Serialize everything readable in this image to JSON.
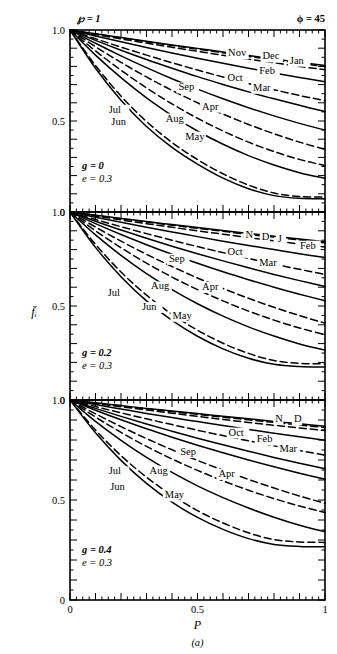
{
  "figure": {
    "caption": "(a)",
    "top_left_param": "℘ = 1",
    "top_right_param": "ϕ = 45",
    "ylabel": "f̄ᵢ",
    "xlabel": "P"
  },
  "axes": {
    "x_ticks": [
      "0",
      "0.5",
      "1"
    ],
    "x_tick_values": [
      0,
      0.5,
      1
    ],
    "x_minor_step": 0.025,
    "x_major_step": 0.1,
    "xlim": [
      0,
      1
    ],
    "y_ticks": [
      "0",
      "0.5",
      "1.0"
    ],
    "y_tick_values": [
      0,
      0.5,
      1.0
    ],
    "y_minor_step": 0.05,
    "y_major_step": 0.1,
    "ylim": [
      0,
      1.0
    ],
    "grid": false
  },
  "panels": [
    {
      "id": "panel-top",
      "g_label": "g = 0",
      "e_label": "e = 0.3",
      "g": 0,
      "e": 0.3,
      "y_top_label": "1.0",
      "y_mid_label": "0.5",
      "y_bot_label": "0",
      "curve_labels": [
        {
          "text": "Nov",
          "x": 0.62,
          "y": 0.855
        },
        {
          "text": "Dec",
          "x": 0.755,
          "y": 0.838
        },
        {
          "text": "Jan",
          "x": 0.862,
          "y": 0.815
        },
        {
          "text": "Feb",
          "x": 0.742,
          "y": 0.757
        },
        {
          "text": "Oct",
          "x": 0.618,
          "y": 0.718
        },
        {
          "text": "Mar",
          "x": 0.718,
          "y": 0.666
        },
        {
          "text": "Sep",
          "x": 0.425,
          "y": 0.668
        },
        {
          "text": "Apr",
          "x": 0.518,
          "y": 0.562
        },
        {
          "text": "Jul",
          "x": 0.152,
          "y": 0.545
        },
        {
          "text": "Jun",
          "x": 0.162,
          "y": 0.478
        },
        {
          "text": "Aug",
          "x": 0.375,
          "y": 0.497
        },
        {
          "text": "May",
          "x": 0.452,
          "y": 0.398
        }
      ]
    },
    {
      "id": "panel-middle",
      "g_label": "g = 0.2",
      "e_label": "e = 0.3",
      "g": 0.2,
      "e": 0.3,
      "y_top_label": "1.0",
      "y_mid_label": "0.5",
      "y_bot_label": "0",
      "curve_labels": [
        {
          "text": "N",
          "x": 0.688,
          "y": 0.862
        },
        {
          "text": "D",
          "x": 0.752,
          "y": 0.852
        },
        {
          "text": "J",
          "x": 0.815,
          "y": 0.838
        },
        {
          "text": "Feb",
          "x": 0.902,
          "y": 0.805
        },
        {
          "text": "Oct",
          "x": 0.618,
          "y": 0.772
        },
        {
          "text": "Mar",
          "x": 0.742,
          "y": 0.712
        },
        {
          "text": "Sep",
          "x": 0.388,
          "y": 0.735
        },
        {
          "text": "Apr",
          "x": 0.518,
          "y": 0.585
        },
        {
          "text": "Aug",
          "x": 0.318,
          "y": 0.588
        },
        {
          "text": "Jul",
          "x": 0.148,
          "y": 0.552
        },
        {
          "text": "Jun",
          "x": 0.282,
          "y": 0.478
        },
        {
          "text": "May",
          "x": 0.402,
          "y": 0.432
        }
      ]
    },
    {
      "id": "panel-bottom",
      "g_label": "g = 0.4",
      "e_label": "e = 0.3",
      "g": 0.4,
      "e": 0.3,
      "y_top_label": "1.0",
      "y_mid_label": "0.5",
      "y_bot_label": "0",
      "curve_labels": [
        {
          "text": "N",
          "x": 0.805,
          "y": 0.892
        },
        {
          "text": "D",
          "x": 0.878,
          "y": 0.888
        },
        {
          "text": "Oct",
          "x": 0.622,
          "y": 0.822
        },
        {
          "text": "Feb",
          "x": 0.732,
          "y": 0.788
        },
        {
          "text": "Mar",
          "x": 0.822,
          "y": 0.742
        },
        {
          "text": "Sep",
          "x": 0.432,
          "y": 0.725
        },
        {
          "text": "Apr",
          "x": 0.582,
          "y": 0.615
        },
        {
          "text": "Aug",
          "x": 0.312,
          "y": 0.632
        },
        {
          "text": "Jul",
          "x": 0.152,
          "y": 0.628
        },
        {
          "text": "Jun",
          "x": 0.158,
          "y": 0.552
        },
        {
          "text": "May",
          "x": 0.372,
          "y": 0.508
        }
      ]
    }
  ],
  "chart_data": {
    "type": "line",
    "title": "",
    "xlabel": "P",
    "ylabel": "f̄ᵢ",
    "xlim": [
      0,
      1
    ],
    "ylim": [
      0,
      1
    ],
    "grid": false,
    "legend": "inline-curve-labels",
    "subplots": [
      {
        "name": "g = 0, e = 0.3",
        "x": [
          0,
          0.1,
          0.2,
          0.3,
          0.4,
          0.5,
          0.6,
          0.7,
          0.8,
          0.9,
          1.0
        ],
        "series": [
          {
            "name": "Jan",
            "style": "dashed",
            "values": [
              1.0,
              0.975,
              0.951,
              0.928,
              0.905,
              0.883,
              0.861,
              0.84,
              0.82,
              0.8,
              0.782
            ]
          },
          {
            "name": "Feb",
            "style": "solid",
            "values": [
              1.0,
              0.967,
              0.935,
              0.904,
              0.874,
              0.845,
              0.817,
              0.79,
              0.764,
              0.739,
              0.716
            ]
          },
          {
            "name": "Mar",
            "style": "dashed",
            "values": [
              1.0,
              0.952,
              0.906,
              0.862,
              0.82,
              0.78,
              0.742,
              0.706,
              0.672,
              0.64,
              0.612
            ]
          },
          {
            "name": "Apr",
            "style": "solid",
            "values": [
              1.0,
              0.927,
              0.858,
              0.793,
              0.732,
              0.675,
              0.622,
              0.573,
              0.528,
              0.487,
              0.45
            ]
          },
          {
            "name": "May",
            "style": "dashed",
            "values": [
              1.0,
              0.885,
              0.779,
              0.682,
              0.594,
              0.515,
              0.445,
              0.384,
              0.332,
              0.289,
              0.255
            ]
          },
          {
            "name": "Jun",
            "style": "solid",
            "values": [
              1.0,
              0.79,
              0.614,
              0.47,
              0.355,
              0.263,
              0.186,
              0.128,
              0.09,
              0.075,
              0.072
            ]
          },
          {
            "name": "Jul",
            "style": "dashed",
            "values": [
              1.0,
              0.805,
              0.637,
              0.497,
              0.382,
              0.288,
              0.21,
              0.148,
              0.104,
              0.085,
              0.082
            ]
          },
          {
            "name": "Aug",
            "style": "solid",
            "values": [
              1.0,
              0.862,
              0.738,
              0.627,
              0.53,
              0.445,
              0.372,
              0.31,
              0.258,
              0.216,
              0.185
            ]
          },
          {
            "name": "Sep",
            "style": "dashed",
            "values": [
              1.0,
              0.908,
              0.822,
              0.742,
              0.668,
              0.6,
              0.538,
              0.481,
              0.43,
              0.384,
              0.344
            ]
          },
          {
            "name": "Oct",
            "style": "solid",
            "values": [
              1.0,
              0.943,
              0.889,
              0.838,
              0.79,
              0.744,
              0.701,
              0.66,
              0.622,
              0.586,
              0.552
            ]
          },
          {
            "name": "Nov",
            "style": "dashed",
            "values": [
              1.0,
              0.978,
              0.957,
              0.936,
              0.915,
              0.895,
              0.875,
              0.855,
              0.836,
              0.817,
              0.799
            ]
          },
          {
            "name": "Dec",
            "style": "solid",
            "values": [
              1.0,
              0.979,
              0.959,
              0.938,
              0.918,
              0.899,
              0.879,
              0.86,
              0.841,
              0.823,
              0.805
            ]
          }
        ]
      },
      {
        "name": "g = 0.2, e = 0.3",
        "x": [
          0,
          0.1,
          0.2,
          0.3,
          0.4,
          0.5,
          0.6,
          0.7,
          0.8,
          0.9,
          1.0
        ],
        "series": [
          {
            "name": "Jan",
            "style": "dashed",
            "values": [
              1.0,
              0.979,
              0.958,
              0.938,
              0.919,
              0.9,
              0.882,
              0.864,
              0.847,
              0.83,
              0.814
            ]
          },
          {
            "name": "Feb",
            "style": "solid",
            "values": [
              1.0,
              0.972,
              0.945,
              0.919,
              0.894,
              0.869,
              0.845,
              0.822,
              0.8,
              0.778,
              0.758
            ]
          },
          {
            "name": "Mar",
            "style": "dashed",
            "values": [
              1.0,
              0.96,
              0.922,
              0.885,
              0.85,
              0.816,
              0.784,
              0.753,
              0.723,
              0.695,
              0.668
            ]
          },
          {
            "name": "Apr",
            "style": "solid",
            "values": [
              1.0,
              0.938,
              0.88,
              0.826,
              0.775,
              0.727,
              0.682,
              0.64,
              0.6,
              0.563,
              0.528
            ]
          },
          {
            "name": "May",
            "style": "dashed",
            "values": [
              1.0,
              0.9,
              0.81,
              0.728,
              0.654,
              0.587,
              0.527,
              0.473,
              0.425,
              0.383,
              0.348
            ]
          },
          {
            "name": "Jun",
            "style": "solid",
            "values": [
              1.0,
              0.812,
              0.656,
              0.527,
              0.423,
              0.339,
              0.272,
              0.222,
              0.19,
              0.178,
              0.175
            ]
          },
          {
            "name": "Jul",
            "style": "dashed",
            "values": [
              1.0,
              0.828,
              0.681,
              0.558,
              0.456,
              0.371,
              0.302,
              0.248,
              0.21,
              0.195,
              0.192
            ]
          },
          {
            "name": "Aug",
            "style": "solid",
            "values": [
              1.0,
              0.878,
              0.769,
              0.672,
              0.587,
              0.512,
              0.446,
              0.389,
              0.34,
              0.298,
              0.265
            ]
          },
          {
            "name": "Sep",
            "style": "dashed",
            "values": [
              1.0,
              0.92,
              0.845,
              0.775,
              0.71,
              0.649,
              0.593,
              0.541,
              0.493,
              0.449,
              0.409
            ]
          },
          {
            "name": "Oct",
            "style": "solid",
            "values": [
              1.0,
              0.951,
              0.904,
              0.86,
              0.818,
              0.778,
              0.74,
              0.703,
              0.668,
              0.635,
              0.604
            ]
          },
          {
            "name": "Nov",
            "style": "dashed",
            "values": [
              1.0,
              0.982,
              0.964,
              0.947,
              0.93,
              0.913,
              0.897,
              0.881,
              0.866,
              0.851,
              0.836
            ]
          },
          {
            "name": "Dec",
            "style": "solid",
            "values": [
              1.0,
              0.983,
              0.966,
              0.949,
              0.933,
              0.917,
              0.901,
              0.886,
              0.871,
              0.856,
              0.842
            ]
          }
        ]
      },
      {
        "name": "g = 0.4, e = 0.3",
        "x": [
          0,
          0.1,
          0.2,
          0.3,
          0.4,
          0.5,
          0.6,
          0.7,
          0.8,
          0.9,
          1.0
        ],
        "series": [
          {
            "name": "Jan",
            "style": "dashed",
            "values": [
              1.0,
              0.983,
              0.966,
              0.95,
              0.934,
              0.918,
              0.903,
              0.888,
              0.874,
              0.86,
              0.847
            ]
          },
          {
            "name": "Feb",
            "style": "solid",
            "values": [
              1.0,
              0.977,
              0.955,
              0.933,
              0.912,
              0.892,
              0.872,
              0.853,
              0.834,
              0.816,
              0.799
            ]
          },
          {
            "name": "Mar",
            "style": "dashed",
            "values": [
              1.0,
              0.967,
              0.936,
              0.906,
              0.877,
              0.849,
              0.822,
              0.796,
              0.771,
              0.747,
              0.724
            ]
          },
          {
            "name": "Apr",
            "style": "solid",
            "values": [
              1.0,
              0.949,
              0.901,
              0.856,
              0.814,
              0.774,
              0.736,
              0.7,
              0.666,
              0.634,
              0.604
            ]
          },
          {
            "name": "May",
            "style": "dashed",
            "values": [
              1.0,
              0.915,
              0.838,
              0.768,
              0.705,
              0.648,
              0.596,
              0.549,
              0.507,
              0.47,
              0.437
            ]
          },
          {
            "name": "Jun",
            "style": "solid",
            "values": [
              1.0,
              0.836,
              0.698,
              0.583,
              0.489,
              0.413,
              0.353,
              0.307,
              0.278,
              0.268,
              0.266
            ]
          },
          {
            "name": "Jul",
            "style": "dashed",
            "values": [
              1.0,
              0.85,
              0.722,
              0.614,
              0.523,
              0.447,
              0.385,
              0.336,
              0.302,
              0.29,
              0.288
            ]
          },
          {
            "name": "Aug",
            "style": "solid",
            "values": [
              1.0,
              0.893,
              0.798,
              0.713,
              0.638,
              0.571,
              0.512,
              0.46,
              0.414,
              0.374,
              0.341
            ]
          },
          {
            "name": "Sep",
            "style": "dashed",
            "values": [
              1.0,
              0.931,
              0.867,
              0.807,
              0.751,
              0.698,
              0.649,
              0.603,
              0.56,
              0.52,
              0.483
            ]
          },
          {
            "name": "Oct",
            "style": "solid",
            "values": [
              1.0,
              0.958,
              0.918,
              0.88,
              0.844,
              0.809,
              0.776,
              0.744,
              0.713,
              0.684,
              0.656
            ]
          },
          {
            "name": "Nov",
            "style": "dashed",
            "values": [
              1.0,
              0.985,
              0.97,
              0.956,
              0.942,
              0.928,
              0.914,
              0.901,
              0.888,
              0.875,
              0.862
            ]
          },
          {
            "name": "Dec",
            "style": "solid",
            "values": [
              1.0,
              0.986,
              0.972,
              0.958,
              0.945,
              0.932,
              0.919,
              0.906,
              0.893,
              0.881,
              0.869
            ]
          }
        ]
      }
    ]
  }
}
